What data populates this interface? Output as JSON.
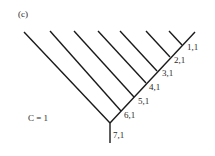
{
  "panel_label": "(c)",
  "annotation": "C = 1",
  "nodes": [
    {
      "label": "1,1"
    },
    {
      "label": "2,1"
    },
    {
      "label": "3,1"
    },
    {
      "label": "4,1"
    },
    {
      "label": "5,1"
    },
    {
      "label": "6,1"
    },
    {
      "label": "7,1"
    }
  ],
  "colors": {
    "line": "#1a1a1a",
    "text": "#2a2a2a",
    "background": "#ffffff"
  }
}
